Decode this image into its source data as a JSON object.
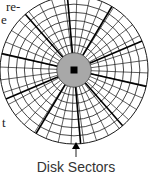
{
  "diagram": {
    "title": "Disk Sectors",
    "label": "Disk Sectors",
    "text_fragments": [
      "re-",
      "e",
      "t"
    ],
    "components": {
      "tracks": "concentric circular tracks",
      "sectors": "radial sector divisions",
      "hub": "grey center hub",
      "spindle": "black square spindle hole"
    },
    "colors": {
      "line": "#1a1a1a",
      "hub": "#a8a8a8",
      "spindle": "#000000",
      "background": "#ffffff"
    },
    "track_count": 7,
    "thin_sector_count": 36,
    "highlighted_sector_boundaries": 10
  }
}
